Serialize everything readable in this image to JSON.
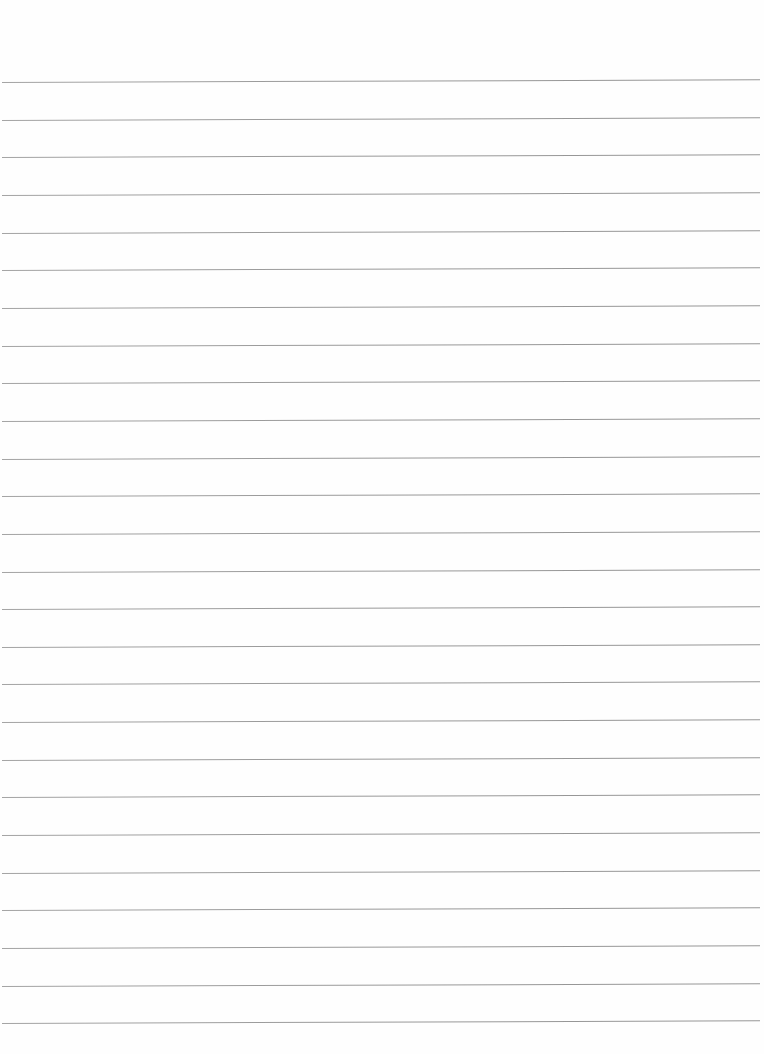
{
  "document": {
    "type": "lined-paper",
    "background_color": "#fefefe",
    "line_color": "#8c8c8c",
    "line_count": 26,
    "first_line_y": 82,
    "line_spacing": 37.65,
    "line_left": 2,
    "line_width": 758
  }
}
